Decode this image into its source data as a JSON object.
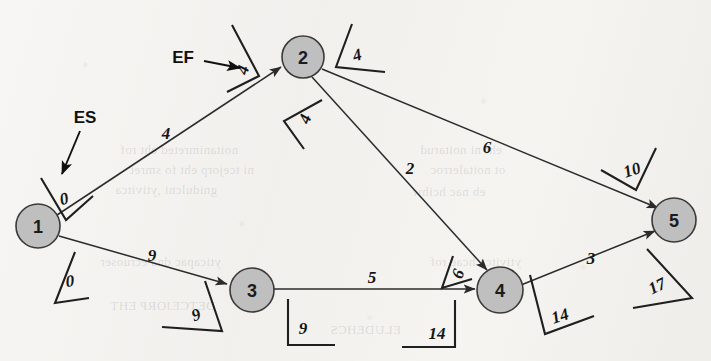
{
  "figure": {
    "type": "activity-on-node-network-diagram",
    "background_color": "#f2f1ee",
    "node_fill": "#bfbfbf",
    "ink_color": "#1f1f1f"
  },
  "annotations": [
    {
      "id": "es",
      "label": "ES",
      "x": 85,
      "y": 117,
      "arrow": {
        "x1": 80,
        "y1": 131,
        "x2": 62,
        "y2": 175
      }
    },
    {
      "id": "ef",
      "label": "EF",
      "x": 183,
      "y": 57,
      "arrow": {
        "x1": 205,
        "y1": 62,
        "x2": 243,
        "y2": 68
      }
    }
  ],
  "nodes": [
    {
      "id": "1",
      "label": "1",
      "cx": 38,
      "cy": 226,
      "r": 22
    },
    {
      "id": "2",
      "label": "2",
      "cx": 303,
      "cy": 57,
      "r": 21
    },
    {
      "id": "3",
      "label": "3",
      "cx": 252,
      "cy": 290,
      "r": 22
    },
    {
      "id": "4",
      "label": "4",
      "cx": 500,
      "cy": 290,
      "r": 23
    },
    {
      "id": "5",
      "label": "5",
      "cx": 674,
      "cy": 220,
      "r": 22
    }
  ],
  "edges": [
    {
      "id": "e12",
      "from": "1",
      "to": "2",
      "duration": "4",
      "dur_x": 166,
      "dur_y": 133
    },
    {
      "id": "e13",
      "from": "1",
      "to": "3",
      "duration": "9",
      "dur_x": 152,
      "dur_y": 255
    },
    {
      "id": "e25",
      "from": "2",
      "to": "5",
      "duration": "6",
      "dur_x": 487,
      "dur_y": 147
    },
    {
      "id": "e24",
      "from": "2",
      "to": "4",
      "duration": "2",
      "dur_x": 410,
      "dur_y": 168
    },
    {
      "id": "e34",
      "from": "3",
      "to": "4",
      "duration": "5",
      "dur_x": 372,
      "dur_y": 277
    },
    {
      "id": "e45",
      "from": "4",
      "to": "5",
      "duration": "3",
      "dur_x": 591,
      "dur_y": 258
    }
  ],
  "time_labels": [
    {
      "id": "es-node1",
      "value": "0",
      "kind": "ES",
      "node": "1"
    },
    {
      "id": "ef-node1",
      "value": "0",
      "kind": "EF",
      "node": "1"
    },
    {
      "id": "ef-edge12",
      "value": "4",
      "kind": "EF",
      "node": "2"
    },
    {
      "id": "es-node2r",
      "value": "4",
      "kind": "ES",
      "node": "2"
    },
    {
      "id": "es-node2b",
      "value": "4",
      "kind": "ES",
      "node": "2"
    },
    {
      "id": "ef-edge13",
      "value": "9",
      "kind": "EF",
      "node": "3"
    },
    {
      "id": "es-node3",
      "value": "9",
      "kind": "ES",
      "node": "3"
    },
    {
      "id": "ef-edge24",
      "value": "6",
      "kind": "EF",
      "node": "4"
    },
    {
      "id": "ef-edge34",
      "value": "14",
      "kind": "EF",
      "node": "4"
    },
    {
      "id": "es-node4",
      "value": "14",
      "kind": "ES",
      "node": "4"
    },
    {
      "id": "ef-edge25",
      "value": "10",
      "kind": "EF",
      "node": "5"
    },
    {
      "id": "ef-edge45",
      "value": "17",
      "kind": "EF",
      "node": "5"
    }
  ],
  "ghost_text": [
    {
      "text": "noitanimreted eht rof",
      "x": 196,
      "y": 150
    },
    {
      "text": "ni tcejorp eht fo smret",
      "x": 196,
      "y": 170
    },
    {
      "text": "gnidulcni ,ytivitca",
      "x": 196,
      "y": 190
    },
    {
      "text": "yticapac dna ecruoser",
      "x": 196,
      "y": 262
    },
    {
      "text": "eht ni noitarud",
      "x": 420,
      "y": 150
    },
    {
      "text": "ot noitalerroc",
      "x": 420,
      "y": 170
    },
    {
      "text": "eb nac hcihw",
      "x": 430,
      "y": 192
    },
    {
      "text": "ytivitca hcae rof",
      "x": 430,
      "y": 262
    },
    {
      "text": "DETCEJORP EHT",
      "x": 150,
      "y": 306
    },
    {
      "text": "ELUDEHCS",
      "x": 330,
      "y": 330
    }
  ]
}
